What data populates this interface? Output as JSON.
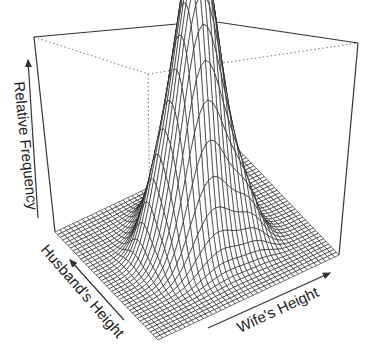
{
  "chart_data": {
    "type": "surface3d",
    "title": "",
    "xlabel": "Wife's Height",
    "ylabel": "Husband's Height",
    "zlabel": "Relative Frequency",
    "grid_resolution": [
      40,
      40
    ],
    "ticks": "none (arrow axes only)",
    "surface_components": [
      {
        "u": 0.5,
        "v": 0.52,
        "su": 0.11,
        "sv": 0.13,
        "w": 1.0
      },
      {
        "u": 0.42,
        "v": 0.4,
        "su": 0.1,
        "sv": 0.08,
        "w": 0.3
      },
      {
        "u": 0.6,
        "v": 0.62,
        "su": 0.08,
        "sv": 0.1,
        "w": 0.35
      },
      {
        "u": 0.3,
        "v": 0.55,
        "su": 0.07,
        "sv": 0.07,
        "w": 0.18
      },
      {
        "u": 0.68,
        "v": 0.35,
        "su": 0.07,
        "sv": 0.08,
        "w": 0.16
      },
      {
        "u": 0.45,
        "v": 0.75,
        "su": 0.06,
        "sv": 0.06,
        "w": 0.14
      }
    ],
    "z_range": [
      0,
      1
    ]
  },
  "axes": {
    "z_label": "Relative Frequency",
    "y_label": "Husband's Height",
    "x_label": "Wife's Height"
  },
  "colors": {
    "mesh": "#1a1a1a",
    "box": "#333333",
    "hidden_box": "#777777",
    "fill": "#ffffff"
  }
}
